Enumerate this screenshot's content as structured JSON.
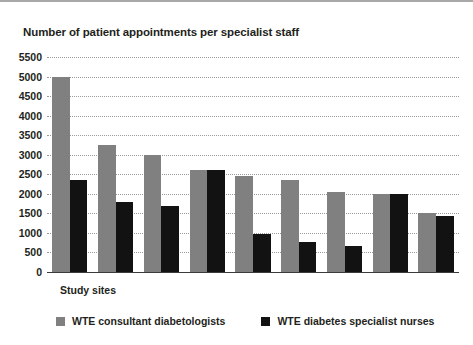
{
  "chart_data": {
    "type": "bar",
    "title": "Number of patient appointments per specialist staff",
    "xlabel": "Study sites",
    "ylabel": "",
    "ylim": [
      0,
      5500
    ],
    "ytick_step": 500,
    "yticks": [
      0,
      500,
      1000,
      1500,
      2000,
      2500,
      3000,
      3500,
      4000,
      4500,
      5000,
      5500
    ],
    "ytick_labels": [
      "0",
      "500",
      "1000",
      "1500",
      "2000",
      "2500",
      "3000",
      "3500",
      "4000",
      "4500",
      "5000",
      "5500"
    ],
    "grid": true,
    "grid_style": "dotted",
    "legend_position": "bottom",
    "categories": [
      "1",
      "2",
      "3",
      "4",
      "5",
      "6",
      "7",
      "8",
      "9"
    ],
    "series": [
      {
        "name": "WTE consultant diabetologists",
        "color": "#808080",
        "values": [
          5000,
          3250,
          3000,
          2600,
          2450,
          2350,
          2050,
          2000,
          1520
        ]
      },
      {
        "name": "WTE diabetes specialist nurses",
        "color": "#121212",
        "values": [
          2350,
          1780,
          1700,
          2600,
          970,
          770,
          660,
          2000,
          1430
        ]
      }
    ]
  },
  "legend": {
    "items": [
      {
        "label": "WTE consultant diabetologists",
        "color": "#808080"
      },
      {
        "label": "WTE diabetes specialist nurses",
        "color": "#121212"
      }
    ]
  }
}
